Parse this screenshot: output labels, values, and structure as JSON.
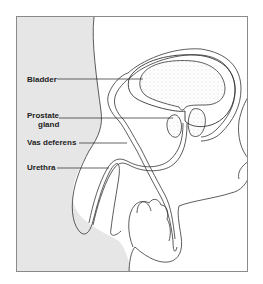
{
  "figure": {
    "type": "anatomical-diagram",
    "labels": [
      {
        "id": "bladder",
        "text": "Bladder"
      },
      {
        "id": "prostate",
        "text": "Prostate gland",
        "lines": [
          "Prostate",
          "gland"
        ]
      },
      {
        "id": "vas",
        "text": "Vas deferens"
      },
      {
        "id": "urethra",
        "text": "Urethra"
      }
    ],
    "colors": {
      "background": "#ffffff",
      "body_shade": "#e6e6e6",
      "outline": "#333333",
      "frame": "#8a8a8a",
      "stipple": "#9a9a9a"
    }
  }
}
